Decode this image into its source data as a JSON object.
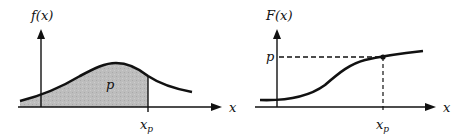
{
  "left_panel": {
    "y_label": "f(x)",
    "x_label": "x",
    "area_label": "p",
    "tick_label": "x",
    "tick_sub": "p",
    "curve": "probability density function",
    "shaded_region": "area under curve left of x_p equals p",
    "shade_color": "#b9b9b9"
  },
  "right_panel": {
    "y_label": "F(x)",
    "x_label": "x",
    "level_label": "p",
    "tick_label": "x",
    "tick_sub": "p",
    "curve": "cumulative distribution function"
  },
  "colors": {
    "ink": "#111111",
    "background": "#ffffff"
  }
}
